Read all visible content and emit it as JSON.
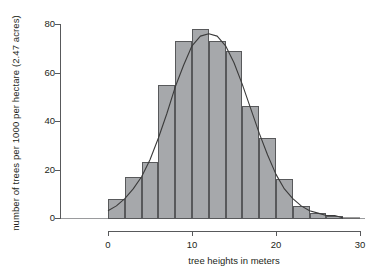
{
  "chart_data": {
    "type": "bar",
    "title": "",
    "subtitle": "",
    "xlabel": "tree heights in meters",
    "ylabel": "number of trees per 1000 per hectare (2.47 acres)",
    "xlim": [
      0,
      30
    ],
    "ylim": [
      0,
      80
    ],
    "grid": false,
    "legend": null,
    "bin_width": 2,
    "xticks": [
      0,
      10,
      20,
      30
    ],
    "xtick_labels": [
      "0",
      "10",
      "20",
      "30"
    ],
    "yticks": [
      0,
      20,
      40,
      60,
      80
    ],
    "ytick_labels": [
      "0",
      "20",
      "40",
      "60",
      "80"
    ],
    "bar_color": "#a6a8ab",
    "bar_edge_color": "#58595b",
    "curve_color": "#3b3b3b",
    "bins": [
      {
        "x0": 0,
        "x1": 2,
        "center": 1,
        "value": 8
      },
      {
        "x0": 2,
        "x1": 4,
        "center": 3,
        "value": 17
      },
      {
        "x0": 4,
        "x1": 6,
        "center": 5,
        "value": 23
      },
      {
        "x0": 6,
        "x1": 8,
        "center": 7,
        "value": 55
      },
      {
        "x0": 8,
        "x1": 10,
        "center": 9,
        "value": 73
      },
      {
        "x0": 10,
        "x1": 12,
        "center": 11,
        "value": 78
      },
      {
        "x0": 12,
        "x1": 14,
        "center": 13,
        "value": 73
      },
      {
        "x0": 14,
        "x1": 16,
        "center": 15,
        "value": 69
      },
      {
        "x0": 16,
        "x1": 18,
        "center": 17,
        "value": 46
      },
      {
        "x0": 18,
        "x1": 20,
        "center": 19,
        "value": 33
      },
      {
        "x0": 20,
        "x1": 22,
        "center": 21,
        "value": 16
      },
      {
        "x0": 22,
        "x1": 24,
        "center": 23,
        "value": 5
      },
      {
        "x0": 24,
        "x1": 26,
        "center": 25,
        "value": 2
      },
      {
        "x0": 26,
        "x1": 28,
        "center": 27,
        "value": 1
      }
    ],
    "categories": [
      "0-2",
      "2-4",
      "4-6",
      "6-8",
      "8-10",
      "10-12",
      "12-14",
      "14-16",
      "16-18",
      "18-20",
      "20-22",
      "22-24",
      "24-26",
      "26-28"
    ],
    "values": [
      8,
      17,
      23,
      55,
      73,
      78,
      73,
      69,
      46,
      33,
      16,
      5,
      2,
      1
    ],
    "overlay_curve": {
      "name": "normal-fit-curve",
      "type": "line",
      "mean": 12.0,
      "peak_value": 76,
      "x": [
        0,
        1,
        2,
        3,
        4,
        5,
        6,
        7,
        8,
        9,
        10,
        11,
        12,
        13,
        14,
        15,
        16,
        17,
        18,
        19,
        20,
        21,
        22,
        23,
        24,
        25,
        26,
        27,
        28,
        29,
        30
      ],
      "y": [
        3,
        5,
        8,
        12,
        17,
        24,
        33,
        43,
        54,
        63,
        71,
        75,
        76,
        75,
        71,
        64,
        55,
        45,
        35,
        26,
        18,
        12,
        8,
        5,
        3,
        2,
        1,
        1,
        0,
        0,
        0
      ]
    }
  }
}
